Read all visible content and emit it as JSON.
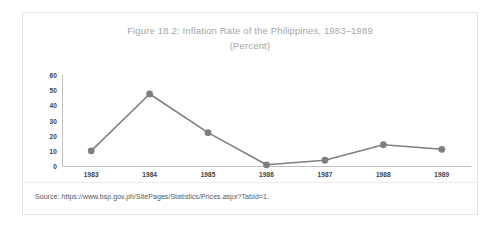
{
  "figure": {
    "title_line_1": "Figure 18.2: Inflation Rate of the Philippines, 1983–1989",
    "title_line_2": "(Percent)",
    "source_note": "Source: https://www.bsp.gov.ph/SitePages/Statistics/Prices.aspx?TabId=1.",
    "colors": {
      "series_line": "#7f7f7f",
      "marker": "#7f7f7f",
      "axis": "#bfbfbf",
      "title_text": "#a6a6a6",
      "tick_text": "#3d3d3d",
      "source_text": "#555555",
      "frame_border": "#e3e3e3",
      "background": "#ffffff"
    }
  },
  "chart_data": {
    "type": "line",
    "title": "Figure 18.2: Inflation Rate of the Philippines, 1983–1989 (Percent)",
    "xlabel": "",
    "ylabel": "",
    "categories": [
      "1983",
      "1984",
      "1985",
      "1986",
      "1987",
      "1988",
      "1989"
    ],
    "x": [
      1983,
      1984,
      1985,
      1986,
      1987,
      1988,
      1989
    ],
    "values": [
      10,
      47.5,
      22,
      0.8,
      3.8,
      14,
      11
    ],
    "series": [
      {
        "name": "Inflation Rate",
        "values": [
          10,
          47.5,
          22,
          0.8,
          3.8,
          14,
          11
        ]
      }
    ],
    "ylim": [
      0,
      60
    ],
    "yticks": [
      0,
      10,
      20,
      30,
      40,
      50,
      60
    ],
    "ytick_labels": [
      "0",
      "10",
      "20",
      "30",
      "40",
      "50",
      "60"
    ],
    "grid": false,
    "legend": false,
    "markers": true
  }
}
